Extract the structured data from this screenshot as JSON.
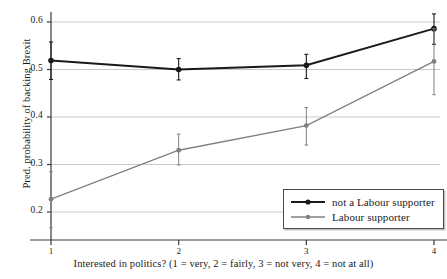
{
  "chart_data": {
    "type": "line",
    "title": "",
    "xlabel": "Interested in politics? (1 = very, 2 = fairly, 3 = not very, 4 = not at all)",
    "ylabel": "Pred. probability of backing Brexit",
    "x": [
      1,
      2,
      3,
      4
    ],
    "xtick_labels": [
      "1",
      "2",
      "3",
      "4"
    ],
    "ytick_labels": [
      "0.2",
      "0.3",
      "0.4",
      "0.5",
      "0.6"
    ],
    "ytick_values": [
      0.2,
      0.3,
      0.4,
      0.5,
      0.6
    ],
    "ylim": [
      0.16,
      0.625
    ],
    "xlim": [
      0.72,
      4.28
    ],
    "grid": "horizontal",
    "legend_position": "bottom-right",
    "series": [
      {
        "name": "not a Labour supporter",
        "color": "#1a1a1a",
        "marker": "circle",
        "values": [
          0.519,
          0.5,
          0.509,
          0.586
        ],
        "err_low": [
          0.479,
          0.478,
          0.481,
          0.553
        ],
        "err_high": [
          0.558,
          0.523,
          0.532,
          0.617
        ]
      },
      {
        "name": "Labour supporter",
        "color": "#808080",
        "marker": "circle",
        "values": [
          0.227,
          0.33,
          0.382,
          0.517
        ],
        "err_low": [
          0.167,
          0.299,
          0.341,
          0.447
        ],
        "err_high": [
          0.285,
          0.364,
          0.42,
          0.586
        ]
      }
    ]
  },
  "legend": {
    "entries": [
      {
        "label": "not a Labour supporter"
      },
      {
        "label": "Labour supporter"
      }
    ]
  }
}
